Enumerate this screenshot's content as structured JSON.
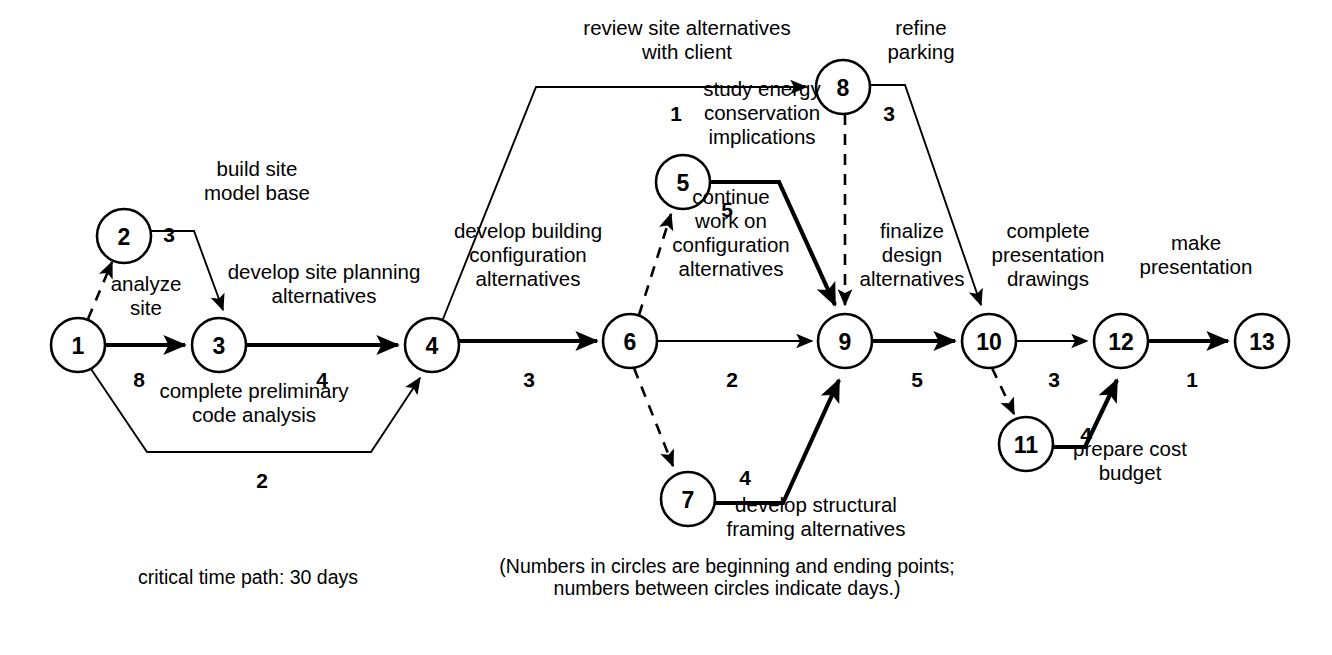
{
  "diagram": {
    "type": "cpm-network-diagram",
    "nodes": [
      {
        "id": "1",
        "label": "1",
        "cx": 78,
        "cy": 345,
        "r": 27
      },
      {
        "id": "2",
        "label": "2",
        "cx": 124,
        "cy": 236,
        "r": 27
      },
      {
        "id": "3",
        "label": "3",
        "cx": 219,
        "cy": 345,
        "r": 27
      },
      {
        "id": "4",
        "label": "4",
        "cx": 432,
        "cy": 345,
        "r": 27
      },
      {
        "id": "5",
        "label": "5",
        "cx": 683,
        "cy": 182,
        "r": 27
      },
      {
        "id": "6",
        "label": "6",
        "cx": 630,
        "cy": 341,
        "r": 27
      },
      {
        "id": "7",
        "label": "7",
        "cx": 688,
        "cy": 499,
        "r": 27
      },
      {
        "id": "8",
        "label": "8",
        "cx": 843,
        "cy": 87,
        "r": 27
      },
      {
        "id": "9",
        "label": "9",
        "cx": 845,
        "cy": 341,
        "r": 27
      },
      {
        "id": "10",
        "label": "10",
        "cx": 989,
        "cy": 341,
        "r": 27
      },
      {
        "id": "11",
        "label": "11",
        "cx": 1026,
        "cy": 444,
        "r": 27
      },
      {
        "id": "12",
        "label": "12",
        "cx": 1121,
        "cy": 341,
        "r": 27
      },
      {
        "id": "13",
        "label": "13",
        "cx": 1262,
        "cy": 341,
        "r": 27
      }
    ],
    "edges": [
      {
        "id": "e1-2",
        "from": "1",
        "to": "2",
        "style": "dashed",
        "duration": "",
        "task": ""
      },
      {
        "id": "e2-3",
        "from": "2",
        "to": "3",
        "style": "thin",
        "duration": "3",
        "task": "build site\nmodel base"
      },
      {
        "id": "e1-3",
        "from": "1",
        "to": "3",
        "style": "thick",
        "duration": "8",
        "task": "analyze\nsite"
      },
      {
        "id": "e3-4",
        "from": "3",
        "to": "4",
        "style": "thick",
        "duration": "4",
        "task": "develop site planning\nalternatives"
      },
      {
        "id": "e1-4",
        "from": "1",
        "to": "4",
        "style": "thin",
        "duration": "2",
        "task": "complete preliminary\ncode analysis"
      },
      {
        "id": "e4-8",
        "from": "4",
        "to": "8",
        "style": "thin",
        "duration": "1",
        "task": "review site alternatives\nwith client"
      },
      {
        "id": "e4-6",
        "from": "4",
        "to": "6",
        "style": "thick",
        "duration": "3",
        "task": "develop building\nconfiguration\nalternatives"
      },
      {
        "id": "e6-5",
        "from": "6",
        "to": "5",
        "style": "dashed",
        "duration": "",
        "task": ""
      },
      {
        "id": "e5-9",
        "from": "5",
        "to": "9",
        "style": "thick",
        "duration": "5",
        "task": "study energy\nconservation\nimplications"
      },
      {
        "id": "e6-9",
        "from": "6",
        "to": "9",
        "style": "thin",
        "duration": "2",
        "task": "continue\nwork on\nconfiguration\nalternatives"
      },
      {
        "id": "e6-7",
        "from": "6",
        "to": "7",
        "style": "dashed",
        "duration": "",
        "task": ""
      },
      {
        "id": "e7-9",
        "from": "7",
        "to": "9",
        "style": "thick",
        "duration": "4",
        "task": "develop structural\nframing alternatives"
      },
      {
        "id": "e8-9",
        "from": "8",
        "to": "9",
        "style": "dashed",
        "duration": "",
        "task": ""
      },
      {
        "id": "e8-10",
        "from": "8",
        "to": "10",
        "style": "thin",
        "duration": "3",
        "task": "refine\nparking"
      },
      {
        "id": "e9-10",
        "from": "9",
        "to": "10",
        "style": "thick",
        "duration": "5",
        "task": "finalize\ndesign\nalternatives"
      },
      {
        "id": "e10-12",
        "from": "10",
        "to": "12",
        "style": "thin",
        "duration": "3",
        "task": "complete\npresentation\ndrawings"
      },
      {
        "id": "e10-11",
        "from": "10",
        "to": "11",
        "style": "dashed",
        "duration": "",
        "task": ""
      },
      {
        "id": "e11-12",
        "from": "11",
        "to": "12",
        "style": "thick",
        "duration": "4",
        "task": "prepare cost\nbudget"
      },
      {
        "id": "e12-13",
        "from": "12",
        "to": "13",
        "style": "thick",
        "duration": "1",
        "task": "make\npresentation"
      }
    ],
    "task_labels": [
      {
        "id": "lbl-build-site-model-base",
        "lines": [
          "build site",
          "model base"
        ],
        "x": 257,
        "y": 188,
        "anchor": "middle"
      },
      {
        "id": "lbl-analyze-site",
        "lines": [
          "analyze",
          "site"
        ],
        "x": 146,
        "y": 303,
        "anchor": "middle"
      },
      {
        "id": "lbl-develop-site-planning",
        "lines": [
          "develop site planning",
          "alternatives"
        ],
        "x": 324,
        "y": 291,
        "anchor": "middle"
      },
      {
        "id": "lbl-complete-preliminary-code",
        "lines": [
          "complete preliminary",
          "code analysis"
        ],
        "x": 254,
        "y": 410,
        "anchor": "middle"
      },
      {
        "id": "lbl-review-site-alternatives",
        "lines": [
          "review site alternatives",
          "with client"
        ],
        "x": 687,
        "y": 47,
        "anchor": "middle"
      },
      {
        "id": "lbl-refine-parking",
        "lines": [
          "refine",
          "parking"
        ],
        "x": 921,
        "y": 47,
        "anchor": "middle"
      },
      {
        "id": "lbl-study-energy-conservation",
        "lines": [
          "study energy",
          "conservation",
          "implications"
        ],
        "x": 762,
        "y": 120,
        "anchor": "middle"
      },
      {
        "id": "lbl-develop-building-config",
        "lines": [
          "develop building",
          "configuration",
          "alternatives"
        ],
        "x": 528,
        "y": 262,
        "anchor": "middle"
      },
      {
        "id": "lbl-continue-work-on-config",
        "lines": [
          "continue",
          "work on",
          "configuration",
          "alternatives"
        ],
        "x": 731,
        "y": 240,
        "anchor": "middle"
      },
      {
        "id": "lbl-finalize-design-alternatives",
        "lines": [
          "finalize",
          "design",
          "alternatives"
        ],
        "x": 912,
        "y": 262,
        "anchor": "middle"
      },
      {
        "id": "lbl-complete-presentation-draw",
        "lines": [
          "complete",
          "presentation",
          "drawings"
        ],
        "x": 1048,
        "y": 262,
        "anchor": "middle"
      },
      {
        "id": "lbl-make-presentation",
        "lines": [
          "make",
          "presentation"
        ],
        "x": 1196,
        "y": 262,
        "anchor": "middle"
      },
      {
        "id": "lbl-develop-structural-framing",
        "lines": [
          "develop structural",
          "framing alternatives"
        ],
        "x": 816,
        "y": 524,
        "anchor": "middle"
      },
      {
        "id": "lbl-prepare-cost-budget",
        "lines": [
          "prepare cost",
          "budget"
        ],
        "x": 1130,
        "y": 468,
        "anchor": "middle"
      }
    ],
    "duration_labels": [
      {
        "id": "dur-2-3",
        "value": "3",
        "x": 169,
        "y": 234
      },
      {
        "id": "dur-1-3",
        "value": "8",
        "x": 139,
        "y": 379
      },
      {
        "id": "dur-3-4",
        "value": "4",
        "x": 322,
        "y": 379
      },
      {
        "id": "dur-1-4",
        "value": "2",
        "x": 262,
        "y": 480
      },
      {
        "id": "dur-4-8",
        "value": "1",
        "x": 676,
        "y": 113
      },
      {
        "id": "dur-5-9",
        "value": "5",
        "x": 727,
        "y": 209
      },
      {
        "id": "dur-4-6",
        "value": "3",
        "x": 529,
        "y": 379
      },
      {
        "id": "dur-6-9",
        "value": "2",
        "x": 732,
        "y": 379
      },
      {
        "id": "dur-8-10",
        "value": "3",
        "x": 889,
        "y": 113
      },
      {
        "id": "dur-9-10",
        "value": "5",
        "x": 917,
        "y": 379
      },
      {
        "id": "dur-10-12",
        "value": "3",
        "x": 1054,
        "y": 379
      },
      {
        "id": "dur-12-13",
        "value": "1",
        "x": 1192,
        "y": 379
      },
      {
        "id": "dur-7-9",
        "value": "4",
        "x": 745,
        "y": 477
      },
      {
        "id": "dur-11-12",
        "value": "4",
        "x": 1086,
        "y": 434
      }
    ],
    "captions": [
      {
        "id": "caption-critical-path",
        "lines": [
          "critical time path: 30 days"
        ],
        "x": 138,
        "y": 584,
        "anchor": "start"
      },
      {
        "id": "caption-legend",
        "lines": [
          "(Numbers in circles are beginning and ending points;",
          "numbers between circles indicate days.)"
        ],
        "x": 727,
        "y": 584,
        "anchor": "middle"
      }
    ],
    "colors": {
      "stroke": "#000000",
      "fill": "#ffffff",
      "background": "#ffffff"
    }
  }
}
